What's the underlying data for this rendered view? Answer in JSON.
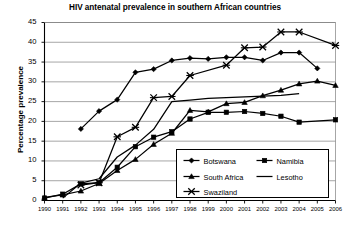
{
  "chart_data": {
    "type": "line",
    "title": "HIV antenatal prevalence in southern African countries",
    "xlabel": "",
    "ylabel": "Percentage prevalence",
    "x": [
      1990,
      1991,
      1992,
      1993,
      1994,
      1995,
      1996,
      1997,
      1998,
      1999,
      2000,
      2001,
      2002,
      2003,
      2004,
      2005,
      2006
    ],
    "xticklabels": [
      "1990",
      "1991",
      "1992",
      "1993",
      "1994",
      "1995",
      "1996",
      "1997",
      "1998",
      "1999",
      "2000",
      "2001",
      "2002",
      "2003",
      "2004",
      "2005",
      "2006"
    ],
    "ylim": [
      0,
      45
    ],
    "yticks": [
      0,
      5,
      10,
      15,
      20,
      25,
      30,
      35,
      40,
      45
    ],
    "yticklabels": [
      "0",
      "5",
      "10",
      "15",
      "20",
      "25",
      "30",
      "35",
      "40",
      "45"
    ],
    "grid": "horizontal",
    "legend_position": "lower-right-inside",
    "series": [
      {
        "name": "Botswana",
        "marker": "diamond",
        "color": "#000000",
        "points": [
          {
            "x": 1992,
            "y": 18.1
          },
          {
            "x": 1993,
            "y": 22.6
          },
          {
            "x": 1994,
            "y": 25.5
          },
          {
            "x": 1995,
            "y": 32.4
          },
          {
            "x": 1996,
            "y": 33.2
          },
          {
            "x": 1997,
            "y": 35.4
          },
          {
            "x": 1998,
            "y": 36.0
          },
          {
            "x": 1999,
            "y": 35.8
          },
          {
            "x": 2000,
            "y": 36.2
          },
          {
            "x": 2001,
            "y": 36.2
          },
          {
            "x": 2002,
            "y": 35.4
          },
          {
            "x": 2003,
            "y": 37.4
          },
          {
            "x": 2004,
            "y": 37.4
          },
          {
            "x": 2005,
            "y": 33.4
          }
        ]
      },
      {
        "name": "Namibia",
        "marker": "square",
        "color": "#000000",
        "points": [
          {
            "x": 1990,
            "y": 0.6
          },
          {
            "x": 1991,
            "y": 1.6
          },
          {
            "x": 1992,
            "y": 4.2
          },
          {
            "x": 1993,
            "y": 4.5
          },
          {
            "x": 1994,
            "y": 8.4
          },
          {
            "x": 1995,
            "y": 13.6
          },
          {
            "x": 1996,
            "y": 16.0
          },
          {
            "x": 1997,
            "y": 17.4
          },
          {
            "x": 1998,
            "y": 20.6
          },
          {
            "x": 1999,
            "y": 22.3
          },
          {
            "x": 2000,
            "y": 22.3
          },
          {
            "x": 2001,
            "y": 22.5
          },
          {
            "x": 2002,
            "y": 22.0
          },
          {
            "x": 2003,
            "y": 21.3
          },
          {
            "x": 2004,
            "y": 19.8
          },
          {
            "x": 2006,
            "y": 20.4
          }
        ]
      },
      {
        "name": "South Africa",
        "marker": "triangle",
        "color": "#000000",
        "points": [
          {
            "x": 1990,
            "y": 0.8
          },
          {
            "x": 1991,
            "y": 1.4
          },
          {
            "x": 1992,
            "y": 2.4
          },
          {
            "x": 1993,
            "y": 4.3
          },
          {
            "x": 1994,
            "y": 7.6
          },
          {
            "x": 1995,
            "y": 10.4
          },
          {
            "x": 1996,
            "y": 14.2
          },
          {
            "x": 1997,
            "y": 17.0
          },
          {
            "x": 1998,
            "y": 22.8
          },
          {
            "x": 1999,
            "y": 22.4
          },
          {
            "x": 2000,
            "y": 24.5
          },
          {
            "x": 2001,
            "y": 24.8
          },
          {
            "x": 2002,
            "y": 26.5
          },
          {
            "x": 2003,
            "y": 27.9
          },
          {
            "x": 2004,
            "y": 29.5
          },
          {
            "x": 2005,
            "y": 30.2
          },
          {
            "x": 2006,
            "y": 29.1
          }
        ]
      },
      {
        "name": "Lesotho",
        "marker": "none",
        "color": "#000000",
        "points": [
          {
            "x": 1991,
            "y": 0.6
          },
          {
            "x": 1992,
            "y": 4.4
          },
          {
            "x": 1993,
            "y": 5.5
          },
          {
            "x": 1994,
            "y": 11.0
          },
          {
            "x": 1995,
            "y": 14.0
          },
          {
            "x": 1996,
            "y": 18.0
          },
          {
            "x": 1997,
            "y": 25.0
          },
          {
            "x": 1998,
            "y": 25.4
          },
          {
            "x": 1999,
            "y": 25.8
          },
          {
            "x": 2000,
            "y": 26.0
          },
          {
            "x": 2001,
            "y": 26.2
          },
          {
            "x": 2002,
            "y": 26.4
          },
          {
            "x": 2003,
            "y": 26.6
          },
          {
            "x": 2004,
            "y": 27.0
          }
        ]
      },
      {
        "name": "Swaziland",
        "marker": "x",
        "color": "#000000",
        "points": [
          {
            "x": 1992,
            "y": 3.9
          },
          {
            "x": 1993,
            "y": 4.5
          },
          {
            "x": 1994,
            "y": 16.1
          },
          {
            "x": 1995,
            "y": 18.5
          },
          {
            "x": 1996,
            "y": 26.0
          },
          {
            "x": 1997,
            "y": 26.3
          },
          {
            "x": 1998,
            "y": 31.6
          },
          {
            "x": 2000,
            "y": 34.2
          },
          {
            "x": 2001,
            "y": 38.6
          },
          {
            "x": 2002,
            "y": 38.8
          },
          {
            "x": 2003,
            "y": 42.6
          },
          {
            "x": 2004,
            "y": 42.6
          },
          {
            "x": 2006,
            "y": 39.2
          }
        ]
      }
    ]
  },
  "legend": {
    "entries": [
      {
        "label": "Botswana",
        "marker": "diamond"
      },
      {
        "label": "Namibia",
        "marker": "square"
      },
      {
        "label": "South Africa",
        "marker": "triangle"
      },
      {
        "label": "Lesotho",
        "marker": "none"
      },
      {
        "label": "Swaziland",
        "marker": "x"
      }
    ]
  },
  "colors": {
    "ink": "#000000",
    "grid": "#808080",
    "background": "#ffffff"
  }
}
